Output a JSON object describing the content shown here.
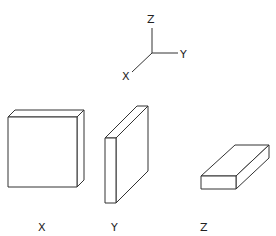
{
  "axes": {
    "z_label": "Z",
    "y_label": "Y",
    "x_label": "X"
  },
  "boxes": [
    {
      "id": "x",
      "label": "X",
      "orientation": "thin along X (large square face front)"
    },
    {
      "id": "y",
      "label": "Y",
      "orientation": "thin along Y (large face on side)"
    },
    {
      "id": "z",
      "label": "Z",
      "orientation": "thin along Z (flat slab)"
    }
  ],
  "colors": {
    "line": "#333333",
    "background": "#ffffff"
  }
}
